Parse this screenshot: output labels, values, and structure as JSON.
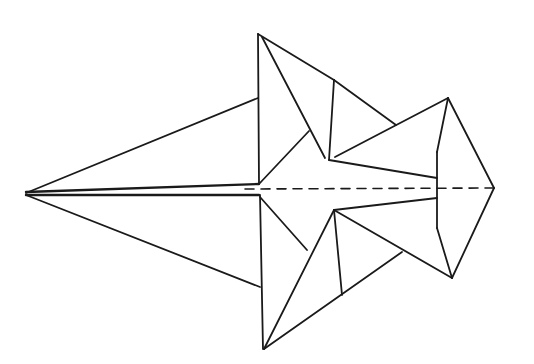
{
  "diagram": {
    "type": "origami-fold-diagram",
    "stroke_color": "#1a1a1a",
    "background_color": "#ffffff",
    "segments": [
      {
        "name": "left-upper-edge",
        "x1": 26,
        "y1": 193,
        "x2": 258,
        "y2": 98
      },
      {
        "name": "left-lower-edge",
        "x1": 26,
        "y1": 195,
        "x2": 260,
        "y2": 287
      },
      {
        "name": "center-spine-upper",
        "x1": 26,
        "y1": 192,
        "x2": 259,
        "y2": 184
      },
      {
        "name": "center-spine-lower",
        "x1": 26,
        "y1": 195,
        "x2": 259,
        "y2": 195
      },
      {
        "name": "top-flap-vertical",
        "x1": 258,
        "y1": 34,
        "x2": 259,
        "y2": 184
      },
      {
        "name": "bottom-flap-vertical",
        "x1": 260,
        "y1": 195,
        "x2": 263,
        "y2": 349
      },
      {
        "name": "top-flap-outer",
        "x1": 258,
        "y1": 34,
        "x2": 334,
        "y2": 80
      },
      {
        "name": "top-flap-inner-diagonal",
        "x1": 262,
        "y1": 37,
        "x2": 325,
        "y2": 158
      },
      {
        "name": "top-inner-fold",
        "x1": 259,
        "y1": 184,
        "x2": 309,
        "y2": 131
      },
      {
        "name": "top-second-vertical",
        "x1": 334,
        "y1": 80,
        "x2": 329,
        "y2": 160
      },
      {
        "name": "top-second-outer",
        "x1": 334,
        "y1": 80,
        "x2": 396,
        "y2": 125
      },
      {
        "name": "top-center-bar",
        "x1": 329,
        "y1": 160,
        "x2": 437,
        "y2": 178
      },
      {
        "name": "top-right-diagonal",
        "x1": 335,
        "y1": 157,
        "x2": 448,
        "y2": 98
      },
      {
        "name": "bottom-inner-fold",
        "x1": 260,
        "y1": 197,
        "x2": 307,
        "y2": 250
      },
      {
        "name": "bottom-flap-diagonal",
        "x1": 264,
        "y1": 349,
        "x2": 334,
        "y2": 210
      },
      {
        "name": "bottom-flap-outer",
        "x1": 264,
        "y1": 349,
        "x2": 402,
        "y2": 252
      },
      {
        "name": "bottom-second-vertical",
        "x1": 334,
        "y1": 210,
        "x2": 342,
        "y2": 295
      },
      {
        "name": "bottom-center-bar",
        "x1": 334,
        "y1": 210,
        "x2": 437,
        "y2": 198
      },
      {
        "name": "bottom-right-diagonal",
        "x1": 334,
        "y1": 210,
        "x2": 452,
        "y2": 278
      },
      {
        "name": "right-kite-upper-outer",
        "x1": 448,
        "y1": 98,
        "x2": 494,
        "y2": 188
      },
      {
        "name": "right-kite-lower-outer",
        "x1": 494,
        "y1": 188,
        "x2": 452,
        "y2": 278
      },
      {
        "name": "right-kite-upper-inner",
        "x1": 448,
        "y1": 98,
        "x2": 437,
        "y2": 152
      },
      {
        "name": "right-kite-vertical",
        "x1": 437,
        "y1": 152,
        "x2": 437,
        "y2": 228
      },
      {
        "name": "right-kite-lower-inner",
        "x1": 437,
        "y1": 228,
        "x2": 452,
        "y2": 278
      }
    ],
    "dashed_centerline": {
      "x1": 245,
      "y1": 189,
      "x2": 494,
      "y2": 188
    }
  }
}
